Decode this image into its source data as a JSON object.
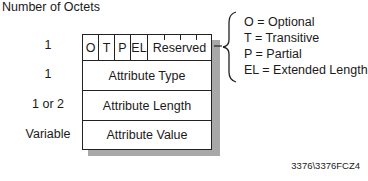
{
  "title": "Number of Octets",
  "fields": [
    {
      "octets": "1",
      "label": "Reserved",
      "flags": [
        "O",
        "T",
        "P",
        "EL"
      ]
    },
    {
      "octets": "1",
      "label": "Attribute Type"
    },
    {
      "octets": "1 or 2",
      "label": "Attribute Length"
    },
    {
      "octets": "Variable",
      "label": "Attribute Value"
    }
  ],
  "legend": [
    "O = Optional",
    "T = Transitive",
    "P = Partial",
    "EL = Extended Length"
  ],
  "footer": "3376\\3376FCZ4",
  "colors": {
    "line": "#222222",
    "shadow": "#a8a8a8",
    "background": "#ffffff"
  }
}
